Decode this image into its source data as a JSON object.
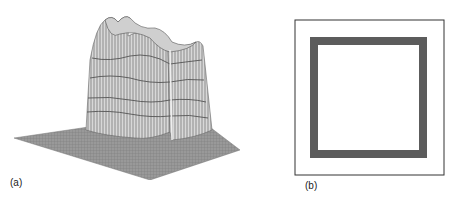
{
  "figure": {
    "panels": [
      {
        "label": "(a)",
        "description": "3D wireframe surface plot of a square plateau on a flat base"
      },
      {
        "label": "(b)",
        "description": "2D map showing a dark square ring inside a framed box"
      }
    ],
    "colors": {
      "base_plane": "#8a8a8a",
      "mesh": "#6e6e6e",
      "ring": "#4a4a4a",
      "frame": "#333333"
    }
  }
}
